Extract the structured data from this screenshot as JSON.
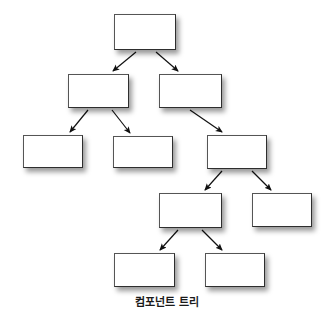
{
  "diagram": {
    "title": "컴포넌트 트리",
    "caption": "컴포넌트 트리",
    "caption_top": 293,
    "caption_font_size": 11,
    "type": "tree",
    "background_color": "#ffffff",
    "node_fill_color": "#ffffff",
    "node_border_color": "#3a3a3a",
    "edge_color": "#1a1a1a",
    "shadow_color": "rgba(0,0,0,0.40)",
    "node_label": "",
    "levels": 5,
    "node_count": 11,
    "edge_count": 10,
    "nodes": [
      {
        "id": "n0",
        "level": 0,
        "label": "",
        "x": 114,
        "y": 14,
        "w": 62,
        "h": 36
      },
      {
        "id": "n1",
        "level": 1,
        "label": "",
        "x": 68,
        "y": 74,
        "w": 61,
        "h": 34
      },
      {
        "id": "n2",
        "level": 1,
        "label": "",
        "x": 159,
        "y": 74,
        "w": 63,
        "h": 34
      },
      {
        "id": "n3",
        "level": 2,
        "label": "",
        "x": 23,
        "y": 135,
        "w": 60,
        "h": 33
      },
      {
        "id": "n4",
        "level": 2,
        "label": "",
        "x": 113,
        "y": 136,
        "w": 60,
        "h": 32
      },
      {
        "id": "n5",
        "level": 2,
        "label": "",
        "x": 207,
        "y": 135,
        "w": 60,
        "h": 34
      },
      {
        "id": "n6",
        "level": 3,
        "label": "",
        "x": 159,
        "y": 193,
        "w": 63,
        "h": 35
      },
      {
        "id": "n7",
        "level": 3,
        "label": "",
        "x": 252,
        "y": 193,
        "w": 60,
        "h": 34
      },
      {
        "id": "n8",
        "level": 4,
        "label": "",
        "x": 114,
        "y": 253,
        "w": 61,
        "h": 34
      },
      {
        "id": "n9",
        "level": 4,
        "label": "",
        "x": 205,
        "y": 253,
        "w": 60,
        "h": 34
      }
    ],
    "edges": [
      {
        "from": "n0",
        "to": "n1",
        "x1": 136,
        "y1": 52,
        "x2": 113,
        "y2": 71
      },
      {
        "from": "n0",
        "to": "n2",
        "x1": 156,
        "y1": 52,
        "x2": 178,
        "y2": 71
      },
      {
        "from": "n1",
        "to": "n3",
        "x1": 88,
        "y1": 110,
        "x2": 70,
        "y2": 132
      },
      {
        "from": "n1",
        "to": "n4",
        "x1": 112,
        "y1": 110,
        "x2": 130,
        "y2": 133
      },
      {
        "from": "n2",
        "to": "n5",
        "x1": 190,
        "y1": 110,
        "x2": 222,
        "y2": 132
      },
      {
        "from": "n5",
        "to": "n6",
        "x1": 222,
        "y1": 171,
        "x2": 205,
        "y2": 190
      },
      {
        "from": "n5",
        "to": "n7",
        "x1": 252,
        "y1": 171,
        "x2": 271,
        "y2": 190
      },
      {
        "from": "n6",
        "to": "n8",
        "x1": 178,
        "y1": 230,
        "x2": 160,
        "y2": 250
      },
      {
        "from": "n6",
        "to": "n9",
        "x1": 202,
        "y1": 230,
        "x2": 222,
        "y2": 250
      }
    ]
  }
}
